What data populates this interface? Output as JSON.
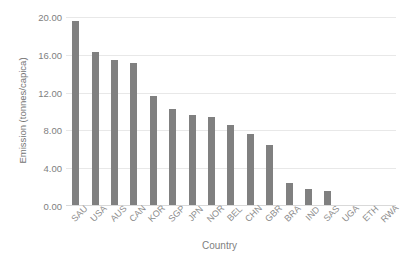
{
  "chart_data": {
    "type": "bar",
    "title": "",
    "xlabel": "Country",
    "ylabel": "Emission (tonnes/capica)",
    "categories": [
      "SAU",
      "USA",
      "AUS",
      "CAN",
      "KOR",
      "SGP",
      "JPN",
      "NOR",
      "BEL",
      "CHN",
      "GBR",
      "BRA",
      "IND",
      "SAS",
      "UGA",
      "ETH",
      "RWA"
    ],
    "values": [
      19.6,
      16.3,
      15.4,
      15.1,
      11.6,
      10.3,
      9.6,
      9.4,
      8.6,
      7.6,
      6.5,
      2.4,
      1.8,
      1.6,
      0.1,
      0.1,
      0.1
    ],
    "ylim": [
      0,
      20
    ],
    "ytick_labels": [
      "20.00",
      "16.00",
      "12.00",
      "8.00",
      "4.00",
      "0.00"
    ],
    "ytick_values": [
      20,
      16,
      12,
      8,
      4,
      0
    ],
    "grid": true,
    "legend": "none",
    "bar_color": "#808080",
    "grid_color": "#e8e8e8",
    "axis_text_color": "#808080"
  }
}
